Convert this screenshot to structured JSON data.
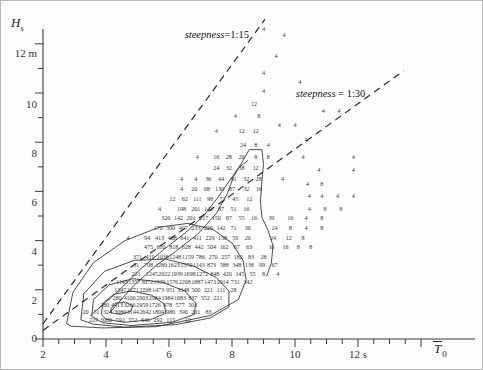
{
  "figure": {
    "kind": "wave-scatter-diagram",
    "y_axis": {
      "symbol": "H",
      "subscript": "s",
      "unit_label": "12 m",
      "ticks": [
        0,
        2,
        4,
        6,
        8,
        10,
        12
      ],
      "tick_labels": [
        "0",
        "2",
        "4",
        "6",
        "8",
        "10",
        "12 m"
      ],
      "minor_step": 1,
      "min": 0,
      "max": 12.8
    },
    "x_axis": {
      "symbol": "T",
      "overbar": true,
      "subscript": "0",
      "unit_label": "12 s",
      "ticks": [
        2,
        4,
        6,
        8,
        10,
        12
      ],
      "tick_labels": [
        "2",
        "4",
        "6",
        "8",
        "10",
        "12 s"
      ],
      "minor_step": 0.5,
      "min": 2,
      "max": 14
    },
    "annotations": [
      {
        "name": "steepness-1-15",
        "prefix": "steepness",
        "eq": "=",
        "value": "1:15",
        "x": 7.45,
        "y": 12.35
      },
      {
        "name": "steepness-1-30",
        "prefix": "steepness",
        "eq": "=",
        "value": "1:30",
        "x": 11.55,
        "y": 9.95
      }
    ],
    "steepness_lines": [
      {
        "name": "line-1-15",
        "ratio": "1:15",
        "x0": 2.0,
        "y0": 0.62,
        "x1": 9.05,
        "y1": 13.0
      },
      {
        "name": "line-1-30",
        "ratio": "1:30",
        "x0": 2.0,
        "y0": 0.35,
        "x1": 13.45,
        "y1": 10.9
      }
    ]
  },
  "chart_data": {
    "type": "scatter",
    "title": "",
    "xlabel": "T̄0 (s)",
    "ylabel": "Hs (m)",
    "xlim": [
      2,
      14
    ],
    "ylim": [
      0,
      12.8
    ],
    "grid": false,
    "legend": "none",
    "x_ticks": [
      2,
      4,
      6,
      8,
      10,
      12
    ],
    "y_ticks": [
      0,
      2,
      4,
      6,
      8,
      10,
      12
    ],
    "cell_unit": "occurrences per 1000",
    "cells": [
      {
        "x": 9.0,
        "y": 12.6,
        "v": "4"
      },
      {
        "x": 9.4,
        "y": 11.5,
        "v": "4"
      },
      {
        "x": 9.0,
        "y": 10.8,
        "v": "4"
      },
      {
        "x": 9.0,
        "y": 10.1,
        "v": "4"
      },
      {
        "x": 8.7,
        "y": 9.55,
        "v": "12"
      },
      {
        "x": 8.1,
        "y": 9.05,
        "v": "4"
      },
      {
        "x": 8.85,
        "y": 9.05,
        "v": "8"
      },
      {
        "x": 7.5,
        "y": 8.45,
        "v": "4"
      },
      {
        "x": 8.3,
        "y": 8.45,
        "v": "12"
      },
      {
        "x": 8.75,
        "y": 8.45,
        "v": "12"
      },
      {
        "x": 8.35,
        "y": 7.9,
        "v": "24"
      },
      {
        "x": 8.75,
        "y": 7.9,
        "v": "8"
      },
      {
        "x": 9.15,
        "y": 7.9,
        "v": "4"
      },
      {
        "x": 6.9,
        "y": 7.4,
        "v": "4"
      },
      {
        "x": 7.5,
        "y": 7.4,
        "v": "16"
      },
      {
        "x": 7.9,
        "y": 7.4,
        "v": "28"
      },
      {
        "x": 8.3,
        "y": 7.4,
        "v": "20"
      },
      {
        "x": 8.75,
        "y": 7.4,
        "v": "8"
      },
      {
        "x": 9.15,
        "y": 7.4,
        "v": "8"
      },
      {
        "x": 7.5,
        "y": 6.95,
        "v": "24"
      },
      {
        "x": 7.9,
        "y": 6.95,
        "v": "32"
      },
      {
        "x": 8.3,
        "y": 6.95,
        "v": "38"
      },
      {
        "x": 8.75,
        "y": 6.95,
        "v": "12"
      },
      {
        "x": 6.4,
        "y": 6.5,
        "v": "4"
      },
      {
        "x": 6.85,
        "y": 6.5,
        "v": "4"
      },
      {
        "x": 7.25,
        "y": 6.5,
        "v": "36"
      },
      {
        "x": 7.65,
        "y": 6.5,
        "v": "44"
      },
      {
        "x": 8.05,
        "y": 6.5,
        "v": "41"
      },
      {
        "x": 8.45,
        "y": 6.5,
        "v": "32"
      },
      {
        "x": 8.85,
        "y": 6.5,
        "v": "28"
      },
      {
        "x": 9.6,
        "y": 6.5,
        "v": "4"
      },
      {
        "x": 6.4,
        "y": 6.1,
        "v": "4"
      },
      {
        "x": 6.8,
        "y": 6.1,
        "v": "20"
      },
      {
        "x": 7.2,
        "y": 6.1,
        "v": "68"
      },
      {
        "x": 7.6,
        "y": 6.1,
        "v": "130"
      },
      {
        "x": 8.0,
        "y": 6.1,
        "v": "87"
      },
      {
        "x": 8.45,
        "y": 6.1,
        "v": "32"
      },
      {
        "x": 8.85,
        "y": 6.1,
        "v": "16"
      },
      {
        "x": 6.1,
        "y": 5.7,
        "v": "12"
      },
      {
        "x": 6.5,
        "y": 5.7,
        "v": "62"
      },
      {
        "x": 6.9,
        "y": 5.7,
        "v": "111"
      },
      {
        "x": 7.3,
        "y": 5.7,
        "v": "98"
      },
      {
        "x": 7.7,
        "y": 5.7,
        "v": "71"
      },
      {
        "x": 8.1,
        "y": 5.7,
        "v": "45"
      },
      {
        "x": 8.55,
        "y": 5.7,
        "v": "12"
      },
      {
        "x": 5.7,
        "y": 5.3,
        "v": "4"
      },
      {
        "x": 6.4,
        "y": 5.3,
        "v": "198"
      },
      {
        "x": 6.85,
        "y": 5.3,
        "v": "201"
      },
      {
        "x": 7.25,
        "y": 5.3,
        "v": "142"
      },
      {
        "x": 7.65,
        "y": 5.3,
        "v": "87"
      },
      {
        "x": 8.05,
        "y": 5.3,
        "v": "51"
      },
      {
        "x": 8.45,
        "y": 5.3,
        "v": "16"
      },
      {
        "x": 5.9,
        "y": 4.9,
        "v": "326"
      },
      {
        "x": 6.3,
        "y": 4.9,
        "v": "142"
      },
      {
        "x": 6.7,
        "y": 4.9,
        "v": "201"
      },
      {
        "x": 7.1,
        "y": 4.9,
        "v": "217"
      },
      {
        "x": 7.5,
        "y": 4.9,
        "v": "150"
      },
      {
        "x": 7.9,
        "y": 4.9,
        "v": "87"
      },
      {
        "x": 8.3,
        "y": 4.9,
        "v": "55"
      },
      {
        "x": 8.7,
        "y": 4.9,
        "v": "16"
      },
      {
        "x": 5.65,
        "y": 4.5,
        "v": "170"
      },
      {
        "x": 6.05,
        "y": 4.5,
        "v": "300"
      },
      {
        "x": 6.45,
        "y": 4.5,
        "v": "407"
      },
      {
        "x": 6.85,
        "y": 4.5,
        "v": "233"
      },
      {
        "x": 7.25,
        "y": 4.5,
        "v": "229"
      },
      {
        "x": 7.65,
        "y": 4.5,
        "v": "142"
      },
      {
        "x": 8.05,
        "y": 4.5,
        "v": "71"
      },
      {
        "x": 8.5,
        "y": 4.5,
        "v": "36"
      },
      {
        "x": 4.7,
        "y": 4.1,
        "v": "4"
      },
      {
        "x": 5.3,
        "y": 4.1,
        "v": "94"
      },
      {
        "x": 5.7,
        "y": 4.1,
        "v": "413"
      },
      {
        "x": 6.1,
        "y": 4.1,
        "v": "408"
      },
      {
        "x": 6.5,
        "y": 4.1,
        "v": "641"
      },
      {
        "x": 6.9,
        "y": 4.1,
        "v": "411"
      },
      {
        "x": 7.3,
        "y": 4.1,
        "v": "229"
      },
      {
        "x": 7.7,
        "y": 4.1,
        "v": "138"
      },
      {
        "x": 8.1,
        "y": 4.1,
        "v": "59"
      },
      {
        "x": 8.5,
        "y": 4.1,
        "v": "20"
      },
      {
        "x": 5.35,
        "y": 3.72,
        "v": "475"
      },
      {
        "x": 5.75,
        "y": 3.72,
        "v": "810"
      },
      {
        "x": 6.15,
        "y": 3.72,
        "v": "818"
      },
      {
        "x": 6.55,
        "y": 3.72,
        "v": "628"
      },
      {
        "x": 6.95,
        "y": 3.72,
        "v": "442"
      },
      {
        "x": 7.35,
        "y": 3.72,
        "v": "504"
      },
      {
        "x": 7.75,
        "y": 3.72,
        "v": "162"
      },
      {
        "x": 8.15,
        "y": 3.72,
        "v": "67"
      },
      {
        "x": 8.55,
        "y": 3.72,
        "v": "63"
      },
      {
        "x": 5.0,
        "y": 3.35,
        "v": "371"
      },
      {
        "x": 5.4,
        "y": 3.35,
        "v": "419"
      },
      {
        "x": 5.8,
        "y": 3.35,
        "v": "1038"
      },
      {
        "x": 6.2,
        "y": 3.35,
        "v": "1248"
      },
      {
        "x": 6.6,
        "y": 3.35,
        "v": "1159"
      },
      {
        "x": 7.0,
        "y": 3.35,
        "v": "786"
      },
      {
        "x": 7.4,
        "y": 3.35,
        "v": "270"
      },
      {
        "x": 7.8,
        "y": 3.35,
        "v": "257"
      },
      {
        "x": 8.2,
        "y": 3.35,
        "v": "182"
      },
      {
        "x": 8.6,
        "y": 3.35,
        "v": "83"
      },
      {
        "x": 9.0,
        "y": 3.35,
        "v": "28"
      },
      {
        "x": 4.95,
        "y": 3.0,
        "v": "31"
      },
      {
        "x": 5.35,
        "y": 3.0,
        "v": "708"
      },
      {
        "x": 5.75,
        "y": 3.0,
        "v": "1280"
      },
      {
        "x": 6.15,
        "y": 3.0,
        "v": "1623"
      },
      {
        "x": 6.55,
        "y": 3.0,
        "v": "1570"
      },
      {
        "x": 6.95,
        "y": 3.0,
        "v": "1143"
      },
      {
        "x": 7.35,
        "y": 3.0,
        "v": "873"
      },
      {
        "x": 7.75,
        "y": 3.0,
        "v": "588"
      },
      {
        "x": 8.15,
        "y": 3.0,
        "v": "348"
      },
      {
        "x": 8.55,
        "y": 3.0,
        "v": "138"
      },
      {
        "x": 8.95,
        "y": 3.0,
        "v": "99"
      },
      {
        "x": 9.35,
        "y": 3.0,
        "v": "67"
      },
      {
        "x": 4.95,
        "y": 2.65,
        "v": "221"
      },
      {
        "x": 5.45,
        "y": 2.65,
        "v": "1245"
      },
      {
        "x": 5.85,
        "y": 2.65,
        "v": "2022"
      },
      {
        "x": 6.25,
        "y": 2.65,
        "v": "1939"
      },
      {
        "x": 6.65,
        "y": 2.65,
        "v": "1698"
      },
      {
        "x": 7.05,
        "y": 2.65,
        "v": "1272"
      },
      {
        "x": 7.45,
        "y": 2.65,
        "v": "848"
      },
      {
        "x": 7.85,
        "y": 2.65,
        "v": "420"
      },
      {
        "x": 8.25,
        "y": 2.65,
        "v": "145"
      },
      {
        "x": 8.65,
        "y": 2.65,
        "v": "55"
      },
      {
        "x": 4.5,
        "y": 2.3,
        "v": "1143"
      },
      {
        "x": 4.9,
        "y": 2.3,
        "v": "1357"
      },
      {
        "x": 5.3,
        "y": 2.3,
        "v": "3072"
      },
      {
        "x": 5.7,
        "y": 2.3,
        "v": "1939"
      },
      {
        "x": 6.1,
        "y": 2.3,
        "v": "1576"
      },
      {
        "x": 6.5,
        "y": 2.3,
        "v": "2208"
      },
      {
        "x": 6.9,
        "y": 2.3,
        "v": "1887"
      },
      {
        "x": 7.3,
        "y": 2.3,
        "v": "1473"
      },
      {
        "x": 7.7,
        "y": 2.3,
        "v": "1014"
      },
      {
        "x": 8.1,
        "y": 2.3,
        "v": "731"
      },
      {
        "x": 8.5,
        "y": 2.3,
        "v": "342"
      },
      {
        "x": 4.45,
        "y": 1.98,
        "v": "1347"
      },
      {
        "x": 4.85,
        "y": 1.98,
        "v": "1271"
      },
      {
        "x": 5.25,
        "y": 1.98,
        "v": "2208"
      },
      {
        "x": 5.65,
        "y": 1.98,
        "v": "1473"
      },
      {
        "x": 6.05,
        "y": 1.98,
        "v": "951"
      },
      {
        "x": 6.45,
        "y": 1.98,
        "v": "3348"
      },
      {
        "x": 6.85,
        "y": 1.98,
        "v": "500"
      },
      {
        "x": 7.25,
        "y": 1.98,
        "v": "221"
      },
      {
        "x": 7.65,
        "y": 1.98,
        "v": "111"
      },
      {
        "x": 8.05,
        "y": 1.98,
        "v": "28"
      },
      {
        "x": 4.35,
        "y": 1.68,
        "v": "280"
      },
      {
        "x": 4.75,
        "y": 1.68,
        "v": "4100"
      },
      {
        "x": 5.15,
        "y": 1.68,
        "v": "2903"
      },
      {
        "x": 5.55,
        "y": 1.68,
        "v": "2984"
      },
      {
        "x": 5.95,
        "y": 1.68,
        "v": "1984"
      },
      {
        "x": 6.35,
        "y": 1.68,
        "v": "1083"
      },
      {
        "x": 6.75,
        "y": 1.68,
        "v": "837"
      },
      {
        "x": 7.15,
        "y": 1.68,
        "v": "552"
      },
      {
        "x": 7.55,
        "y": 1.68,
        "v": "221"
      },
      {
        "x": 3.95,
        "y": 1.38,
        "v": "280"
      },
      {
        "x": 4.35,
        "y": 1.38,
        "v": "4413"
      },
      {
        "x": 4.75,
        "y": 1.38,
        "v": "3266"
      },
      {
        "x": 5.15,
        "y": 1.38,
        "v": "2959"
      },
      {
        "x": 5.55,
        "y": 1.38,
        "v": "1726"
      },
      {
        "x": 5.95,
        "y": 1.38,
        "v": "978"
      },
      {
        "x": 6.35,
        "y": 1.38,
        "v": "577"
      },
      {
        "x": 6.75,
        "y": 1.38,
        "v": "503"
      },
      {
        "x": 3.35,
        "y": 1.08,
        "v": "20"
      },
      {
        "x": 3.7,
        "y": 1.08,
        "v": "51"
      },
      {
        "x": 4.05,
        "y": 1.08,
        "v": "324"
      },
      {
        "x": 4.45,
        "y": 1.08,
        "v": "3080"
      },
      {
        "x": 4.85,
        "y": 1.08,
        "v": "3144"
      },
      {
        "x": 5.25,
        "y": 1.08,
        "v": "2642"
      },
      {
        "x": 5.65,
        "y": 1.08,
        "v": "1804"
      },
      {
        "x": 6.05,
        "y": 1.08,
        "v": "980"
      },
      {
        "x": 6.45,
        "y": 1.08,
        "v": "390"
      },
      {
        "x": 6.85,
        "y": 1.08,
        "v": "201"
      },
      {
        "x": 7.25,
        "y": 1.08,
        "v": "83"
      },
      {
        "x": 3.6,
        "y": 0.78,
        "v": "229"
      },
      {
        "x": 4.0,
        "y": 0.78,
        "v": "3080"
      },
      {
        "x": 4.45,
        "y": 0.78,
        "v": "592"
      },
      {
        "x": 4.85,
        "y": 0.78,
        "v": "552"
      },
      {
        "x": 5.25,
        "y": 0.78,
        "v": "646"
      },
      {
        "x": 5.65,
        "y": 0.78,
        "v": "292"
      },
      {
        "x": 6.05,
        "y": 0.78,
        "v": "115"
      },
      {
        "x": 6.6,
        "y": 0.78,
        "v": "12"
      },
      {
        "x": 9.65,
        "y": 12.35,
        "v": "4"
      },
      {
        "x": 10.15,
        "y": 10.45,
        "v": "4"
      },
      {
        "x": 10.9,
        "y": 9.25,
        "v": "4"
      },
      {
        "x": 11.4,
        "y": 9.25,
        "v": "4"
      },
      {
        "x": 9.5,
        "y": 8.7,
        "v": "4"
      },
      {
        "x": 10.0,
        "y": 8.7,
        "v": "4"
      },
      {
        "x": 10.35,
        "y": 8.1,
        "v": "4"
      },
      {
        "x": 10.25,
        "y": 7.4,
        "v": "4"
      },
      {
        "x": 11.85,
        "y": 7.4,
        "v": "4"
      },
      {
        "x": 10.75,
        "y": 6.85,
        "v": "4"
      },
      {
        "x": 11.85,
        "y": 6.85,
        "v": "4"
      },
      {
        "x": 10.4,
        "y": 6.3,
        "v": "4"
      },
      {
        "x": 10.85,
        "y": 6.3,
        "v": "8"
      },
      {
        "x": 10.45,
        "y": 5.8,
        "v": "4"
      },
      {
        "x": 10.85,
        "y": 5.8,
        "v": "4"
      },
      {
        "x": 11.35,
        "y": 5.8,
        "v": "4"
      },
      {
        "x": 11.85,
        "y": 5.8,
        "v": "4"
      },
      {
        "x": 10.45,
        "y": 5.3,
        "v": "4"
      },
      {
        "x": 10.95,
        "y": 5.3,
        "v": "8"
      },
      {
        "x": 11.45,
        "y": 5.3,
        "v": "8"
      },
      {
        "x": 9.25,
        "y": 4.9,
        "v": "39"
      },
      {
        "x": 9.85,
        "y": 4.9,
        "v": "16"
      },
      {
        "x": 10.35,
        "y": 4.9,
        "v": "4"
      },
      {
        "x": 10.85,
        "y": 4.9,
        "v": "8"
      },
      {
        "x": 9.35,
        "y": 4.5,
        "v": "24"
      },
      {
        "x": 9.85,
        "y": 4.5,
        "v": "8"
      },
      {
        "x": 10.35,
        "y": 4.5,
        "v": "4"
      },
      {
        "x": 10.85,
        "y": 4.5,
        "v": "8"
      },
      {
        "x": 9.3,
        "y": 4.1,
        "v": "24"
      },
      {
        "x": 9.8,
        "y": 4.1,
        "v": "12"
      },
      {
        "x": 10.25,
        "y": 4.1,
        "v": "8"
      },
      {
        "x": 9.25,
        "y": 3.72,
        "v": "16"
      },
      {
        "x": 9.7,
        "y": 3.72,
        "v": "16"
      },
      {
        "x": 10.1,
        "y": 3.72,
        "v": "8"
      },
      {
        "x": 10.5,
        "y": 3.72,
        "v": "8"
      },
      {
        "x": 9.0,
        "y": 2.65,
        "v": "8"
      },
      {
        "x": 9.45,
        "y": 2.65,
        "v": "4"
      }
    ],
    "contours": [
      {
        "level": "outer-1",
        "closed": false
      },
      {
        "level": "outer-2",
        "closed": false
      },
      {
        "level": "mid-1",
        "closed": true
      },
      {
        "level": "mid-2",
        "closed": true
      },
      {
        "level": "core",
        "closed": true
      }
    ]
  }
}
